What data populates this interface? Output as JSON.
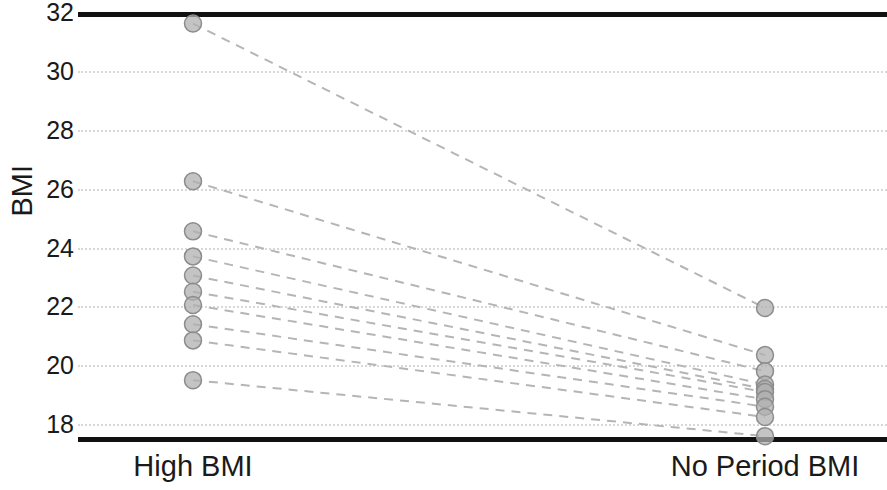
{
  "chart_data": {
    "type": "line",
    "title": "",
    "subtitle": "",
    "xlabel": "",
    "ylabel": "BMI",
    "categories": [
      "High BMI",
      "No Period BMI"
    ],
    "x": [
      0,
      1
    ],
    "ylim": [
      17.3,
      32.4
    ],
    "yticks": [
      18,
      20,
      22,
      24,
      26,
      28,
      30,
      32
    ],
    "ytick_labels": [
      "18",
      "20",
      "22",
      "24",
      "26",
      "28",
      "30",
      "32"
    ],
    "grid": "horizontal-dotted",
    "legend": "none",
    "style": "paired-slope-chart",
    "marker": "circle",
    "marker_color": "#b0b0b0",
    "marker_edge_color": "#8c8c8c",
    "line_style": "dashed",
    "line_color": "#b5b5b5",
    "series": [
      {
        "name": "subject-1",
        "values": [
          31.6,
          21.95
        ]
      },
      {
        "name": "subject-2",
        "values": [
          26.25,
          20.35
        ]
      },
      {
        "name": "subject-3",
        "values": [
          24.55,
          19.8
        ]
      },
      {
        "name": "subject-4",
        "values": [
          23.7,
          19.35
        ]
      },
      {
        "name": "subject-5",
        "values": [
          23.05,
          19.2
        ]
      },
      {
        "name": "subject-6",
        "values": [
          22.5,
          19.1
        ]
      },
      {
        "name": "subject-7",
        "values": [
          22.05,
          18.85
        ]
      },
      {
        "name": "subject-8",
        "values": [
          21.4,
          18.6
        ]
      },
      {
        "name": "subject-9",
        "values": [
          20.85,
          18.25
        ]
      },
      {
        "name": "subject-10",
        "values": [
          19.5,
          17.6
        ]
      }
    ],
    "n_pairs": 10,
    "annotations": []
  },
  "axes": {
    "y_title": "BMI",
    "x_tick_labels": [
      "High BMI",
      "No Period BMI"
    ]
  },
  "colors": {
    "spine": "#111111",
    "grid": "#d8d8d8",
    "marker_fill": "#b0b0b0",
    "marker_edge": "#8c8c8c",
    "connector": "#b5b5b5",
    "text": "#1a1a1a",
    "background": "#ffffff"
  }
}
